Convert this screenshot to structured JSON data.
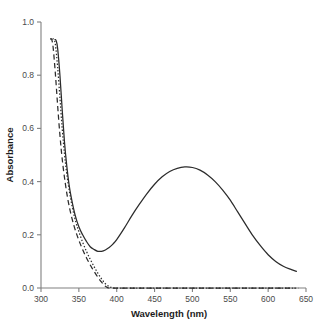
{
  "chart_data": {
    "type": "line",
    "title": "",
    "xlabel": "Wavelength (nm)",
    "ylabel": "Absorbance",
    "xlim": [
      300,
      650
    ],
    "ylim": [
      0.0,
      1.0
    ],
    "xticks": [
      300,
      350,
      400,
      450,
      500,
      550,
      600,
      650
    ],
    "xtick_labels": [
      "300",
      "350",
      "400",
      "450",
      "500",
      "550",
      "600",
      "650"
    ],
    "yticks": [
      0.0,
      0.2,
      0.4,
      0.6,
      0.8,
      1.0
    ],
    "ytick_labels": [
      "0.0",
      "0.2",
      "0.4",
      "0.6",
      "0.8",
      "1.0"
    ],
    "grid": false,
    "legend": "none",
    "series": [
      {
        "name": "solid-curve",
        "style": "solid",
        "color": "#2b2b2b",
        "x": [
          318,
          320,
          322,
          325,
          328,
          331,
          334,
          337,
          340,
          345,
          350,
          355,
          360,
          365,
          370,
          375,
          380,
          385,
          390,
          395,
          400,
          410,
          420,
          430,
          440,
          450,
          460,
          470,
          480,
          490,
          500,
          510,
          520,
          530,
          540,
          550,
          560,
          570,
          580,
          590,
          600,
          610,
          620,
          630,
          638
        ],
        "y": [
          0.935,
          0.93,
          0.9,
          0.8,
          0.67,
          0.55,
          0.46,
          0.39,
          0.34,
          0.275,
          0.23,
          0.2,
          0.175,
          0.155,
          0.145,
          0.138,
          0.138,
          0.143,
          0.152,
          0.165,
          0.182,
          0.225,
          0.272,
          0.315,
          0.355,
          0.39,
          0.418,
          0.438,
          0.45,
          0.455,
          0.453,
          0.443,
          0.425,
          0.4,
          0.368,
          0.33,
          0.285,
          0.24,
          0.196,
          0.158,
          0.125,
          0.1,
          0.082,
          0.07,
          0.062
        ]
      },
      {
        "name": "dotted-curve",
        "style": "dotted",
        "color": "#2b2b2b",
        "x": [
          315,
          317,
          319,
          322,
          325,
          328,
          331,
          334,
          338,
          342,
          346,
          350,
          355,
          360,
          365,
          370,
          375,
          380,
          385,
          390,
          393,
          396,
          400,
          420,
          450,
          480,
          510,
          540,
          570,
          600,
          625,
          640
        ],
        "y": [
          0.935,
          0.935,
          0.915,
          0.83,
          0.715,
          0.6,
          0.505,
          0.43,
          0.355,
          0.295,
          0.248,
          0.212,
          0.172,
          0.138,
          0.108,
          0.081,
          0.056,
          0.034,
          0.016,
          0.005,
          0.002,
          0.0,
          0.0,
          0.0,
          0.0,
          0.0,
          0.0,
          0.0,
          0.0,
          0.0,
          0.0,
          0.0
        ]
      },
      {
        "name": "dashed-curve",
        "style": "dashed",
        "color": "#2b2b2b",
        "x": [
          312,
          314,
          316,
          319,
          322,
          325,
          328,
          332,
          336,
          340,
          344,
          348,
          352,
          356,
          360,
          364,
          368,
          372,
          376,
          380,
          384,
          387,
          390,
          400,
          430,
          460,
          490,
          520,
          550,
          580,
          610,
          635
        ],
        "y": [
          0.935,
          0.935,
          0.905,
          0.805,
          0.685,
          0.575,
          0.485,
          0.395,
          0.325,
          0.272,
          0.23,
          0.195,
          0.165,
          0.138,
          0.114,
          0.092,
          0.072,
          0.054,
          0.037,
          0.022,
          0.009,
          0.003,
          0.0,
          0.0,
          0.0,
          0.0,
          0.0,
          0.0,
          0.0,
          0.0,
          0.0,
          0.0
        ]
      }
    ]
  }
}
